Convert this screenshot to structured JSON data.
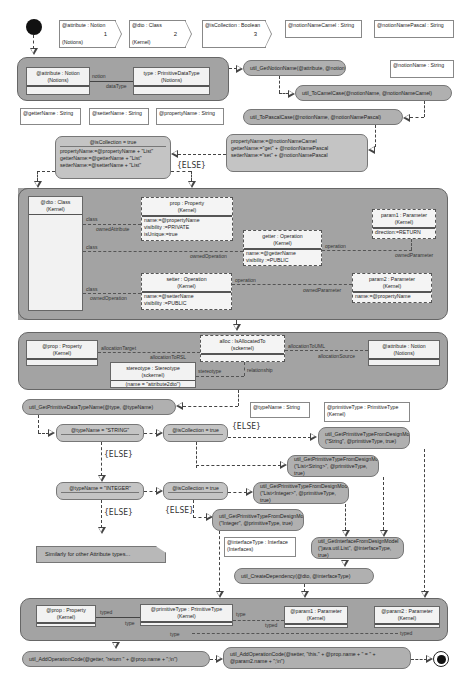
{
  "parameters": [
    {
      "name": "@attribute : Notion",
      "package": "(Notions)",
      "index": "1"
    },
    {
      "name": "@dto : Class",
      "package": "(Kernel)",
      "index": "2"
    },
    {
      "name": "@isCollection : Boolean",
      "package": "",
      "index": "3"
    }
  ],
  "variables": {
    "notionNameCamel": "@notionNameCamel : String",
    "notionNamePascal": "@notionNamePascal : String",
    "notionName": "@notionName : String",
    "getterName": "@getterName : String",
    "setterName": "@setterName : String",
    "propertyName": "@propertyName : String",
    "typeName": "@typeName : String",
    "primitiveType": {
      "name": "@primitiveType : PrimitiveType",
      "package": "(Kernel)"
    },
    "interfaceType": {
      "name": "@interfaceType : Interface",
      "package": "(Interfaces)"
    }
  },
  "region1": {
    "attribute": {
      "name": "@attribute : Notion",
      "package": "(Notions)"
    },
    "type": {
      "name": "type : PrimitiveDataType",
      "package": "(Notions)"
    },
    "link_labels": [
      "notion",
      "dataType"
    ]
  },
  "actions": {
    "getNotionName": "util_GetNotionName(@attribute, @notionName)",
    "toCamelCase": "util_ToCamelCase(@notionName, @notionNameCamel)",
    "toPascalCase": "util_ToPascalCase(@notionName, @notionNamePascal)",
    "getPrimitiveDataTypeName": "util_GetPrimitiveDataTypeName(@type, @typeName)",
    "gptString_l1": "util_GetPrimitiveTypeFromDesignModel",
    "gptString_l2": "(\"String\", @primitiveType, true)",
    "gptListString_l1": "util_GetPrimitiveTypeFromDesignModel",
    "gptListString_l2": "(\"List<String>\", @primitiveType, true)",
    "gptListInteger_l1": "util_GetPrimitiveTypeFromDesignModel",
    "gptListInteger_l2": "(\"List<Integer>\", @primitiveType, true)",
    "gptInteger_l1": "util_GetPrimitiveTypeFromDesignModel",
    "gptInteger_l2": "(\"Integer\", @primitiveType, true)",
    "getInterface_l1": "util_GetInterfaceFromDesignModel",
    "getInterface_l2": "(\"java.util.List\", @interfaceType, true)",
    "createDependency": "util_CreateDependency(@dto, @interfaceType)",
    "addOpGetter": "util_AddOperationCode(@getter, \"return \" + @prop.name + \";\\n\")",
    "addOpSetter_l1": "util_AddOperationCode(@setter, \"this.\" + @prop.name + \" = \" +",
    "addOpSetter_l2": "@param2.name + \";\\n\")"
  },
  "decisions": {
    "isCollectionTrue1": {
      "header": "@isCollection = true",
      "lines": [
        "propertyName:=@propertyName + \"List\"",
        "getterName:=@getterName + \"List\"",
        "setterName:=@setterName + \"List\""
      ]
    },
    "assign": {
      "lines": [
        "propertyName:=@notionNameCamel",
        "getterName:=\"get\" + @notionNamePascal",
        "setterName:=\"set\" + @notionNamePascal"
      ]
    },
    "typeString": "@typeName = \"STRING\"",
    "isCollection2": "@isCollection = true",
    "typeInteger": "@typeName = \"INTEGER\"",
    "isCollection3": "@isCollection = true"
  },
  "else_label": "{ELSE}",
  "region2": {
    "dto": {
      "name": "@dto : Class",
      "package": "(Kernel)"
    },
    "prop": {
      "name": "prop : Property",
      "package": "(Kernel)",
      "attrs": [
        "name:=@propertyName",
        "visibility :=PRIVATE",
        "isUnique:=true"
      ]
    },
    "getter": {
      "name": "getter : Operation",
      "package": "(Kernel)",
      "attrs": [
        "name:=@getterName",
        "visibility :=PUBLIC"
      ]
    },
    "setter": {
      "name": "setter : Operation",
      "package": "(Kernel)",
      "attrs": [
        "name:=@setterName",
        "visibility :=PUBLIC"
      ]
    },
    "param1": {
      "name": "param1 : Parameter",
      "package": "(Kernel)",
      "attrs": [
        "direction:=RETURN"
      ]
    },
    "param2": {
      "name": "param2 : Parameter",
      "package": "(Kernel)",
      "attrs": [
        "name:=@propertyName"
      ]
    },
    "labels": {
      "class": "class",
      "ownedAttribute": "ownedAttribute",
      "ownedOperation": "ownedOperation",
      "operation": "operation",
      "ownedParameter": "ownedParameter"
    }
  },
  "region3": {
    "prop": {
      "name": "@prop : Property",
      "package": "(Kernel)"
    },
    "alloc": {
      "name": "alloc : IsAllocatedTo",
      "package": "(sckernel)"
    },
    "attribute": {
      "name": "@attribute : Notion",
      "package": "(Notions)"
    },
    "stereotype": {
      "name": "stereotype : Stereotype",
      "package": "(sckernel)",
      "attrs": [
        "(name = \"attribute2dto\")"
      ]
    },
    "labels": {
      "allocationTarget": "allocationTarget",
      "allocationToRSL": "allocationToRSL",
      "allocationToUML": "allocationToUML",
      "allocationSource": "allocationSource",
      "stereotype": "stereotype",
      "relationship": "relationship"
    }
  },
  "note": "Similarly for other Attribute types...",
  "region4": {
    "prop": {
      "name": "@prop : Property",
      "package": "(Kernel)"
    },
    "primitiveType": {
      "name": "@primitiveType : PrimitiveType",
      "package": "(Kernel)"
    },
    "param1": {
      "name": "@param1 : Parameter",
      "package": "(Kernel)"
    },
    "param2": {
      "name": "@param2 : Parameter",
      "package": "(Kernel)"
    },
    "labels": {
      "typed": "typed",
      "type": "type"
    }
  }
}
